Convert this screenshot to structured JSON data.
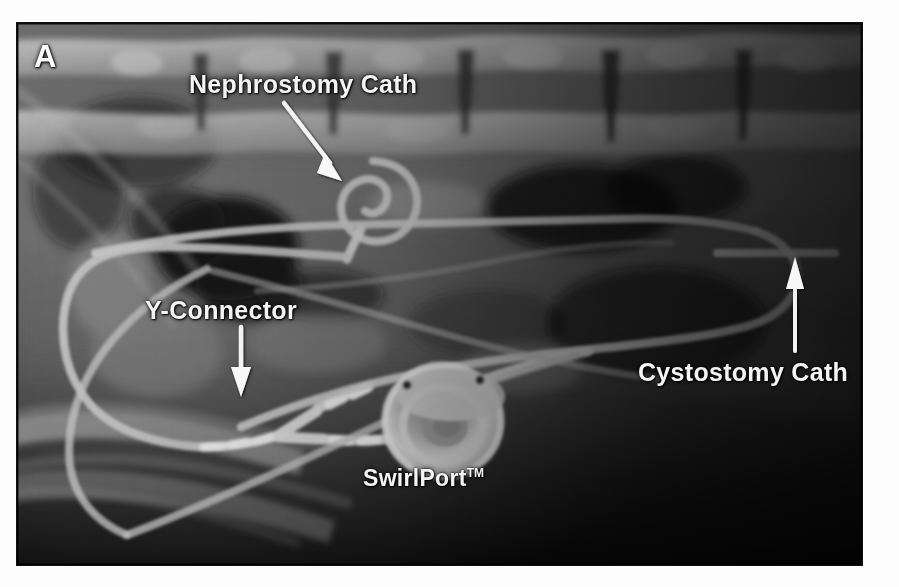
{
  "figure": {
    "panel_letter": "A",
    "modality": "radiograph",
    "background_color": "#ffffff",
    "panel_border_color": "#101010",
    "annotation_text_color": "#f4f4f4"
  },
  "annotations": [
    {
      "key": "nephrostomy",
      "label": "Nephrostomy Cath",
      "icon": "arrow-down-right-icon",
      "arrow_direction": "down-right"
    },
    {
      "key": "yconnector",
      "label": "Y-Connector",
      "icon": "arrow-down-icon",
      "arrow_direction": "down"
    },
    {
      "key": "cystostomy",
      "label": "Cystostomy Cath",
      "icon": "arrow-up-icon",
      "arrow_direction": "up"
    },
    {
      "key": "swirlport",
      "label": "SwirlPort",
      "trademark": "TM",
      "icon": "none",
      "arrow_direction": "none"
    }
  ],
  "devices": [
    {
      "name": "nephrostomy-catheter",
      "shape": "pigtail-coil"
    },
    {
      "name": "cystostomy-catheter",
      "shape": "curved-tube"
    },
    {
      "name": "y-connector",
      "shape": "y-junction"
    },
    {
      "name": "swirlport-device",
      "shape": "circular-port"
    }
  ]
}
